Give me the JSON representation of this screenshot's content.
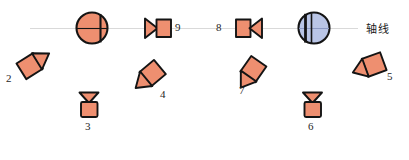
{
  "diagram": {
    "title_label": "轴线",
    "colors": {
      "valve_fill": "#EE8F70",
      "valve_stroke": "#1a1a1a",
      "disc_blue_fill": "#B9C5E6",
      "axis_line": "#d9d9d9",
      "label_text": "#262626",
      "background": "#ffffff"
    },
    "axis": {
      "name": "axis-line",
      "label": "轴线",
      "x_start": 30,
      "x_end": 358,
      "y": 28,
      "color": "#d9d9d9"
    },
    "items": [
      {
        "id": "2",
        "label": "2",
        "shape": "rotated-square-with-triangle",
        "name": "valve-symbol-2",
        "label_x": 8,
        "label_y": 78,
        "cx": 31,
        "cy": 65,
        "rotation": -35
      },
      {
        "id": "3",
        "label": "3",
        "shape": "funnel-over-rectangle",
        "name": "valve-symbol-3",
        "label_x": 84,
        "label_y": 128,
        "cx": 89,
        "cy": 105,
        "rotation": 0
      },
      {
        "id": "4",
        "label": "4",
        "shape": "rotated-square-with-triangle",
        "name": "valve-symbol-4",
        "label_x": 160,
        "label_y": 96,
        "cx": 148,
        "cy": 72,
        "rotation": 135
      },
      {
        "id": "5",
        "label": "5",
        "shape": "rotated-square-with-triangle",
        "name": "valve-symbol-5",
        "label_x": 386,
        "label_y": 78,
        "cx": 369,
        "cy": 64,
        "rotation": 160
      },
      {
        "id": "6",
        "label": "6",
        "shape": "funnel-over-rectangle",
        "name": "valve-symbol-6",
        "label_x": 307,
        "label_y": 128,
        "cx": 312,
        "cy": 105,
        "rotation": 0
      },
      {
        "id": "7",
        "label": "7",
        "shape": "rotated-square-with-triangle",
        "name": "valve-symbol-7",
        "label_x": 240,
        "label_y": 92,
        "cx": 249,
        "cy": 68,
        "rotation": 125
      },
      {
        "id": "8",
        "label": "8",
        "shape": "rect-then-triangle-left",
        "name": "valve-symbol-8",
        "label_x": 216,
        "label_y": 32,
        "cx": 250,
        "cy": 28,
        "rotation": 0
      },
      {
        "id": "9",
        "label": "9",
        "shape": "triangle-then-rect-right",
        "name": "valve-symbol-9",
        "label_x": 174,
        "label_y": 32,
        "cx": 157,
        "cy": 28,
        "rotation": 0
      },
      {
        "id": "disc-left",
        "label": "",
        "shape": "circle-orange-disc",
        "name": "disc-valve-left",
        "label_x": 0,
        "label_y": 0,
        "cx": 92,
        "cy": 28,
        "rotation": 0
      },
      {
        "id": "disc-right",
        "label": "",
        "shape": "circle-blue-disc",
        "name": "disc-valve-right",
        "label_x": 0,
        "label_y": 0,
        "cx": 314,
        "cy": 28,
        "rotation": 0
      }
    ]
  }
}
